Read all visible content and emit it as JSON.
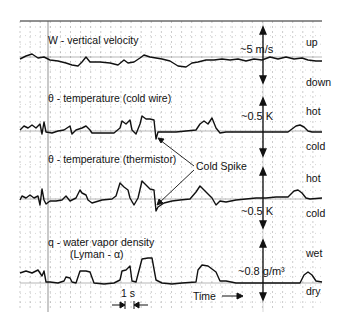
{
  "chart_data": {
    "type": "line",
    "title": "",
    "xlabel": "Time",
    "time_scale_label": "1 s",
    "grid": true,
    "panels": [
      {
        "id": "w",
        "label": "W - vertical velocity",
        "scale": "~5 m/s",
        "upper": "up",
        "lower": "down",
        "baseline_y": 57,
        "points": [
          [
            20,
            59
          ],
          [
            26,
            56
          ],
          [
            32,
            54
          ],
          [
            38,
            58
          ],
          [
            44,
            57
          ],
          [
            50,
            60
          ],
          [
            58,
            61
          ],
          [
            66,
            63
          ],
          [
            72,
            65
          ],
          [
            78,
            66
          ],
          [
            82,
            62
          ],
          [
            86,
            57
          ],
          [
            90,
            62
          ],
          [
            100,
            62
          ],
          [
            110,
            63
          ],
          [
            118,
            65
          ],
          [
            124,
            60
          ],
          [
            128,
            63
          ],
          [
            134,
            62
          ],
          [
            140,
            58
          ],
          [
            144,
            55
          ],
          [
            150,
            57
          ],
          [
            156,
            58
          ],
          [
            162,
            59
          ],
          [
            170,
            61
          ],
          [
            178,
            66
          ],
          [
            186,
            67
          ],
          [
            192,
            63
          ],
          [
            198,
            62
          ],
          [
            206,
            60
          ],
          [
            214,
            60
          ],
          [
            222,
            59
          ],
          [
            230,
            60
          ],
          [
            238,
            59
          ],
          [
            246,
            61
          ],
          [
            254,
            59
          ],
          [
            262,
            60
          ],
          [
            270,
            57
          ],
          [
            278,
            59
          ],
          [
            286,
            57
          ],
          [
            294,
            59
          ],
          [
            302,
            58
          ],
          [
            308,
            60
          ],
          [
            316,
            61
          ],
          [
            322,
            61
          ]
        ]
      },
      {
        "id": "theta_cold_wire",
        "label": "θ - temperature (cold wire)",
        "scale": "~0.5 K",
        "upper": "hot",
        "lower": "cold",
        "baseline_y": 131,
        "points": [
          [
            20,
            130
          ],
          [
            24,
            126
          ],
          [
            28,
            128
          ],
          [
            32,
            125
          ],
          [
            36,
            128
          ],
          [
            40,
            124
          ],
          [
            42,
            134
          ],
          [
            44,
            122
          ],
          [
            46,
            132
          ],
          [
            52,
            133
          ],
          [
            58,
            131
          ],
          [
            64,
            130
          ],
          [
            70,
            126
          ],
          [
            72,
            134
          ],
          [
            76,
            130
          ],
          [
            82,
            128
          ],
          [
            86,
            126
          ],
          [
            90,
            130
          ],
          [
            92,
            133
          ],
          [
            104,
            133
          ],
          [
            114,
            133
          ],
          [
            120,
            128
          ],
          [
            122,
            121
          ],
          [
            126,
            124
          ],
          [
            130,
            120
          ],
          [
            132,
            130
          ],
          [
            136,
            134
          ],
          [
            140,
            124
          ],
          [
            142,
            116
          ],
          [
            146,
            119
          ],
          [
            150,
            119
          ],
          [
            154,
            120
          ],
          [
            156,
            139
          ],
          [
            158,
            132
          ],
          [
            166,
            132
          ],
          [
            176,
            132
          ],
          [
            186,
            131
          ],
          [
            196,
            130
          ],
          [
            200,
            124
          ],
          [
            204,
            121
          ],
          [
            208,
            124
          ],
          [
            212,
            118
          ],
          [
            216,
            128
          ],
          [
            220,
            133
          ],
          [
            226,
            132
          ],
          [
            236,
            132
          ],
          [
            246,
            132
          ],
          [
            256,
            132
          ],
          [
            266,
            132
          ],
          [
            276,
            132
          ],
          [
            288,
            132
          ],
          [
            296,
            126
          ],
          [
            300,
            125
          ],
          [
            304,
            127
          ],
          [
            308,
            131
          ],
          [
            312,
            132
          ],
          [
            322,
            132
          ]
        ]
      },
      {
        "id": "theta_thermistor",
        "label": "θ - temperature (thermistor)",
        "scale": "~0.5 K",
        "upper": "hot",
        "lower": "cold",
        "baseline_y": 199,
        "points": [
          [
            20,
            200
          ],
          [
            22,
            196
          ],
          [
            26,
            198
          ],
          [
            30,
            195
          ],
          [
            34,
            198
          ],
          [
            38,
            196
          ],
          [
            40,
            205
          ],
          [
            42,
            189
          ],
          [
            44,
            200
          ],
          [
            46,
            204
          ],
          [
            50,
            201
          ],
          [
            56,
            201
          ],
          [
            62,
            200
          ],
          [
            66,
            196
          ],
          [
            70,
            201
          ],
          [
            76,
            198
          ],
          [
            80,
            190
          ],
          [
            82,
            193
          ],
          [
            86,
            195
          ],
          [
            88,
            200
          ],
          [
            92,
            203
          ],
          [
            102,
            200
          ],
          [
            112,
            199
          ],
          [
            116,
            196
          ],
          [
            120,
            183
          ],
          [
            124,
            187
          ],
          [
            128,
            190
          ],
          [
            130,
            198
          ],
          [
            134,
            205
          ],
          [
            138,
            198
          ],
          [
            142,
            181
          ],
          [
            146,
            185
          ],
          [
            150,
            189
          ],
          [
            154,
            190
          ],
          [
            156,
            211
          ],
          [
            158,
            207
          ],
          [
            164,
            203
          ],
          [
            172,
            201
          ],
          [
            180,
            200
          ],
          [
            190,
            199
          ],
          [
            196,
            192
          ],
          [
            200,
            186
          ],
          [
            204,
            190
          ],
          [
            208,
            194
          ],
          [
            212,
            198
          ],
          [
            216,
            205
          ],
          [
            220,
            201
          ],
          [
            226,
            202
          ],
          [
            236,
            200
          ],
          [
            246,
            199
          ],
          [
            256,
            198
          ],
          [
            266,
            198
          ],
          [
            276,
            197
          ],
          [
            288,
            197
          ],
          [
            294,
            191
          ],
          [
            298,
            190
          ],
          [
            302,
            193
          ],
          [
            306,
            198
          ],
          [
            310,
            199
          ],
          [
            322,
            198
          ]
        ]
      },
      {
        "id": "q_water_vapor",
        "label": "q - water vapor density",
        "sublabel": "(Lyman - α)",
        "scale": "~0.8 g/m³",
        "upper": "wet",
        "lower": "dry",
        "baseline_y": 283,
        "points": [
          [
            20,
            273
          ],
          [
            26,
            271
          ],
          [
            32,
            273
          ],
          [
            38,
            270
          ],
          [
            42,
            276
          ],
          [
            44,
            271
          ],
          [
            46,
            282
          ],
          [
            50,
            282
          ],
          [
            58,
            283
          ],
          [
            64,
            281
          ],
          [
            66,
            277
          ],
          [
            70,
            278
          ],
          [
            72,
            282
          ],
          [
            76,
            283
          ],
          [
            80,
            271
          ],
          [
            86,
            271
          ],
          [
            90,
            272
          ],
          [
            94,
            283
          ],
          [
            104,
            284
          ],
          [
            114,
            283
          ],
          [
            120,
            280
          ],
          [
            122,
            271
          ],
          [
            126,
            270
          ],
          [
            130,
            266
          ],
          [
            132,
            281
          ],
          [
            136,
            282
          ],
          [
            142,
            259
          ],
          [
            148,
            258
          ],
          [
            152,
            258
          ],
          [
            156,
            280
          ],
          [
            162,
            283
          ],
          [
            172,
            284
          ],
          [
            182,
            283
          ],
          [
            196,
            282
          ],
          [
            198,
            270
          ],
          [
            202,
            265
          ],
          [
            208,
            266
          ],
          [
            216,
            272
          ],
          [
            220,
            281
          ],
          [
            226,
            281
          ],
          [
            236,
            283
          ],
          [
            246,
            283
          ],
          [
            256,
            283
          ],
          [
            270,
            283
          ],
          [
            282,
            283
          ],
          [
            300,
            283
          ],
          [
            304,
            275
          ],
          [
            308,
            272
          ],
          [
            312,
            275
          ],
          [
            316,
            281
          ],
          [
            322,
            282
          ]
        ]
      }
    ],
    "annotations": [
      {
        "text": "Cold Spike",
        "x": 200,
        "y": 168
      },
      {
        "text": "1 s",
        "x": 124,
        "y": 297
      },
      {
        "text": "Time",
        "x": 190,
        "y": 299
      }
    ]
  },
  "figure": {
    "trace_color": "#111111",
    "grid_color": "#555555",
    "background": "#ffffff"
  }
}
